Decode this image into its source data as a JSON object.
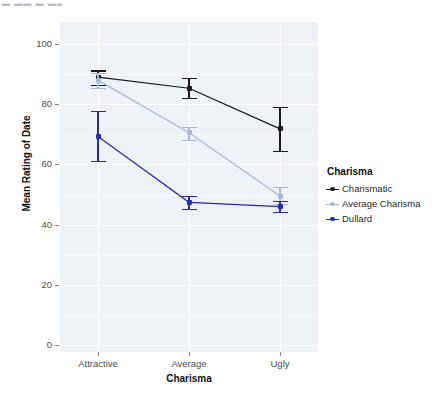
{
  "artifact": {
    "top_text": "▬ ▬▬ ▬ ▬▬ ▬"
  },
  "chart_data": {
    "type": "line",
    "title": "",
    "xlabel": "Charisma",
    "ylabel": "Mean Rating of Date",
    "categories": [
      "Attractive",
      "Average",
      "Ugly"
    ],
    "ylim": [
      0,
      100
    ],
    "ytick_labels": [
      "0",
      "20",
      "40",
      "60",
      "80",
      "100"
    ],
    "ytick_values": [
      0,
      20,
      40,
      60,
      80,
      100
    ],
    "grid": true,
    "legend_position": "right",
    "legend_title": "Charisma",
    "error_bars": "95% CI",
    "series": [
      {
        "name": "Charismatic",
        "color": "#1a1a1a",
        "values": [
          89.0,
          85.3,
          71.8
        ],
        "err_low": [
          86.3,
          82.1,
          64.6
        ],
        "err_high": [
          91.2,
          88.6,
          79.0
        ]
      },
      {
        "name": "Average Charisma",
        "color": "#a9b9d9",
        "values": [
          88.0,
          70.5,
          49.5
        ],
        "err_low": [
          85.5,
          68.1,
          46.8
        ],
        "err_high": [
          90.4,
          72.4,
          52.4
        ]
      },
      {
        "name": "Dullard",
        "color": "#2b2bab",
        "values": [
          69.3,
          47.4,
          46.0
        ],
        "err_low": [
          61.1,
          45.2,
          44.3
        ],
        "err_high": [
          77.7,
          49.4,
          47.9
        ]
      }
    ]
  },
  "panel": {
    "background_color": "#eef1f6",
    "gridline_color": "#ffffff"
  }
}
